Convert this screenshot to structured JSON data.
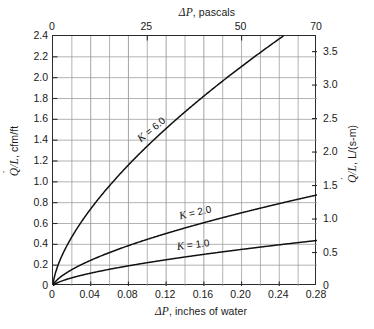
{
  "chart_data": {
    "type": "line",
    "title": "",
    "xlabel": "ΔP, inches of water",
    "xlabel_top": "ΔP, pascals",
    "ylabel": "Q/L, cfm/ft",
    "ylabel_right": "Q/L, L/(s-m)",
    "xlim": [
      0,
      0.28
    ],
    "ylim": [
      0,
      2.4
    ],
    "xlim_top": [
      0,
      70
    ],
    "ylim_right": [
      0,
      3.733
    ],
    "grid": true,
    "legend": "inline-curve-labels",
    "xticks": [
      0,
      0.04,
      0.08,
      0.12,
      0.16,
      0.2,
      0.24,
      0.28
    ],
    "xticklabels": [
      "0",
      "0.04",
      "0.08",
      "0.12",
      "0.16",
      "0.20",
      "0.24",
      "0.28"
    ],
    "xticks_top": [
      0,
      25,
      50,
      70
    ],
    "xticklabels_top": [
      "0",
      "25",
      "50",
      "70"
    ],
    "yticks": [
      0,
      0.2,
      0.4,
      0.6,
      0.8,
      1.0,
      1.2,
      1.4,
      1.6,
      1.8,
      2.0,
      2.2,
      2.4
    ],
    "yticklabels": [
      "0",
      "0.2",
      "0.4",
      "0.6",
      "0.8",
      "1.0",
      "1.2",
      "1.4",
      "1.6",
      "1.8",
      "2.0",
      "2.2",
      "2.4"
    ],
    "yticks_right": [
      0,
      0.5,
      1.0,
      1.5,
      2.0,
      2.5,
      3.0,
      3.5
    ],
    "yticklabels_right": [
      "0",
      "0.5",
      "1.0",
      "1.5",
      "2.0",
      "2.5",
      "3.0",
      "3.5"
    ],
    "gridlines_x_minor_step": 0.02,
    "gridlines_y_step": 0.2,
    "exponent": 0.65,
    "series": [
      {
        "name": "K = 6.0",
        "K": 6.0,
        "label": "K = 6.0",
        "label_k": "K",
        "label_value": " = 6.0",
        "x": [
          0,
          0.005,
          0.01,
          0.02,
          0.03,
          0.04,
          0.06,
          0.08,
          0.1,
          0.12,
          0.14,
          0.16,
          0.18,
          0.2,
          0.22,
          0.2485
        ],
        "y": [
          0,
          0.182,
          0.286,
          0.449,
          0.586,
          0.705,
          0.913,
          1.106,
          1.282,
          1.447,
          1.603,
          1.751,
          1.894,
          2.031,
          2.164,
          2.4
        ]
      },
      {
        "name": "K = 2.0",
        "K": 2.0,
        "label": "K = 2.0",
        "label_k": "K",
        "label_value": " = 2.0",
        "x": [
          0,
          0.005,
          0.01,
          0.02,
          0.04,
          0.06,
          0.08,
          0.1,
          0.12,
          0.16,
          0.2,
          0.24,
          0.28
        ],
        "y": [
          0,
          0.061,
          0.095,
          0.15,
          0.235,
          0.304,
          0.369,
          0.427,
          0.482,
          0.584,
          0.677,
          0.765,
          0.847
        ]
      },
      {
        "name": "K = 1.0",
        "K": 1.0,
        "label": "K = 1.0",
        "label_k": "K",
        "label_value": " = 1.0",
        "x": [
          0,
          0.005,
          0.01,
          0.02,
          0.04,
          0.06,
          0.08,
          0.1,
          0.12,
          0.16,
          0.2,
          0.24,
          0.28
        ],
        "y": [
          0,
          0.03,
          0.048,
          0.075,
          0.117,
          0.152,
          0.185,
          0.213,
          0.241,
          0.292,
          0.338,
          0.382,
          0.424
        ]
      }
    ],
    "colors": {
      "curve": "#111111",
      "grid": "#9a9a9a",
      "frame": "#2b2b2b",
      "text": "#1a1a1a",
      "background": "#ffffff"
    }
  },
  "axes": {
    "top_title": "ΔP, pascals",
    "bottom_title": "ΔP, inches of water",
    "left_title_unit": ", cfm/ft",
    "right_title_unit": ", L/(s-m)",
    "left_title_symbol": "Q/L",
    "right_title_symbol": "Q/L",
    "delta_symbol": "ΔP"
  }
}
